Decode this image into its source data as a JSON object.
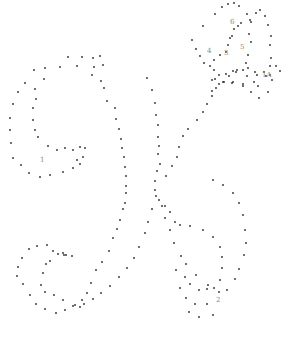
{
  "puzzle": {
    "subject": "cursive letter K dot-to-dot",
    "dot_color": "#2a2a2a",
    "label_color": "#8a8a8a",
    "labels": [
      {
        "text": "1",
        "x": 40,
        "y": 162
      },
      {
        "text": "2",
        "x": 216,
        "y": 302
      },
      {
        "text": "3",
        "x": 224,
        "y": 55
      },
      {
        "text": "4",
        "x": 207,
        "y": 53
      },
      {
        "text": "5",
        "x": 240,
        "y": 49
      },
      {
        "text": "6",
        "x": 230,
        "y": 24
      },
      {
        "text": "1A",
        "x": 262,
        "y": 77
      }
    ],
    "dots": [
      [
        68,
        57
      ],
      [
        82,
        57
      ],
      [
        93,
        58
      ],
      [
        100,
        56
      ],
      [
        103,
        65
      ],
      [
        94,
        67
      ],
      [
        77,
        66
      ],
      [
        60,
        67
      ],
      [
        45,
        68
      ],
      [
        34,
        70
      ],
      [
        25,
        83
      ],
      [
        18,
        92
      ],
      [
        13,
        104
      ],
      [
        10,
        118
      ],
      [
        10,
        130
      ],
      [
        11,
        143
      ],
      [
        13,
        158
      ],
      [
        21,
        165
      ],
      [
        29,
        173
      ],
      [
        40,
        177
      ],
      [
        50,
        175
      ],
      [
        63,
        172
      ],
      [
        73,
        168
      ],
      [
        80,
        164
      ],
      [
        44,
        79
      ],
      [
        35,
        89
      ],
      [
        36,
        99
      ],
      [
        33,
        108
      ],
      [
        33,
        120
      ],
      [
        35,
        130
      ],
      [
        38,
        137
      ],
      [
        48,
        146
      ],
      [
        57,
        150
      ],
      [
        65,
        148
      ],
      [
        73,
        150
      ],
      [
        80,
        147
      ],
      [
        85,
        148
      ],
      [
        83,
        157
      ],
      [
        77,
        160
      ],
      [
        92,
        75
      ],
      [
        101,
        81
      ],
      [
        104,
        88
      ],
      [
        107,
        101
      ],
      [
        115,
        108
      ],
      [
        116,
        119
      ],
      [
        119,
        129
      ],
      [
        121,
        139
      ],
      [
        122,
        148
      ],
      [
        124,
        157
      ],
      [
        125,
        167
      ],
      [
        126,
        176
      ],
      [
        126,
        186
      ],
      [
        126,
        193
      ],
      [
        125,
        203
      ],
      [
        123,
        209
      ],
      [
        120,
        220
      ],
      [
        117,
        229
      ],
      [
        113,
        238
      ],
      [
        109,
        251
      ],
      [
        102,
        262
      ],
      [
        96,
        270
      ],
      [
        91,
        283
      ],
      [
        87,
        293
      ],
      [
        82,
        300
      ],
      [
        75,
        305
      ],
      [
        65,
        310
      ],
      [
        56,
        313
      ],
      [
        45,
        309
      ],
      [
        36,
        304
      ],
      [
        30,
        295
      ],
      [
        23,
        284
      ],
      [
        17,
        276
      ],
      [
        18,
        267
      ],
      [
        22,
        258
      ],
      [
        29,
        249
      ],
      [
        37,
        246
      ],
      [
        47,
        245
      ],
      [
        53,
        251
      ],
      [
        63,
        253
      ],
      [
        64,
        255
      ],
      [
        147,
        78
      ],
      [
        152,
        90
      ],
      [
        155,
        103
      ],
      [
        156,
        115
      ],
      [
        158,
        125
      ],
      [
        158,
        137
      ],
      [
        159,
        146
      ],
      [
        158,
        154
      ],
      [
        160,
        164
      ],
      [
        157,
        171
      ],
      [
        155,
        181
      ],
      [
        156,
        196
      ],
      [
        152,
        209
      ],
      [
        148,
        222
      ],
      [
        145,
        233
      ],
      [
        139,
        247
      ],
      [
        134,
        258
      ],
      [
        127,
        268
      ],
      [
        119,
        277
      ],
      [
        110,
        286
      ],
      [
        101,
        293
      ],
      [
        93,
        299
      ],
      [
        84,
        304
      ],
      [
        80,
        307
      ],
      [
        73,
        306
      ],
      [
        63,
        300
      ],
      [
        54,
        295
      ],
      [
        45,
        292
      ],
      [
        41,
        285
      ],
      [
        43,
        273
      ],
      [
        46,
        264
      ],
      [
        50,
        261
      ],
      [
        58,
        254
      ],
      [
        66,
        255
      ],
      [
        72,
        256
      ],
      [
        155,
        190
      ],
      [
        162,
        206
      ],
      [
        165,
        218
      ],
      [
        170,
        230
      ],
      [
        174,
        243
      ],
      [
        181,
        256
      ],
      [
        186,
        264
      ],
      [
        196,
        275
      ],
      [
        208,
        285
      ],
      [
        219,
        292
      ],
      [
        227,
        290
      ],
      [
        235,
        279
      ],
      [
        239,
        269
      ],
      [
        244,
        255
      ],
      [
        246,
        243
      ],
      [
        245,
        230
      ],
      [
        243,
        215
      ],
      [
        239,
        203
      ],
      [
        233,
        193
      ],
      [
        223,
        185
      ],
      [
        213,
        180
      ],
      [
        159,
        200
      ],
      [
        165,
        206
      ],
      [
        170,
        212
      ],
      [
        175,
        222
      ],
      [
        180,
        225
      ],
      [
        190,
        226
      ],
      [
        203,
        230
      ],
      [
        213,
        237
      ],
      [
        220,
        247
      ],
      [
        222,
        257
      ],
      [
        222,
        268
      ],
      [
        220,
        280
      ],
      [
        214,
        288
      ],
      [
        207,
        289
      ],
      [
        199,
        290
      ],
      [
        190,
        284
      ],
      [
        185,
        277
      ],
      [
        176,
        270
      ],
      [
        180,
        288
      ],
      [
        186,
        298
      ],
      [
        195,
        304
      ],
      [
        207,
        304
      ],
      [
        213,
        315
      ],
      [
        199,
        317
      ],
      [
        189,
        312
      ],
      [
        166,
        176
      ],
      [
        172,
        166
      ],
      [
        177,
        157
      ],
      [
        179,
        147
      ],
      [
        183,
        136
      ],
      [
        188,
        129
      ],
      [
        197,
        120
      ],
      [
        203,
        112
      ],
      [
        207,
        104
      ],
      [
        212,
        96
      ],
      [
        216,
        88
      ],
      [
        224,
        82
      ],
      [
        229,
        76
      ],
      [
        237,
        70
      ],
      [
        248,
        68
      ],
      [
        255,
        72
      ],
      [
        266,
        76
      ],
      [
        272,
        80
      ],
      [
        268,
        92
      ],
      [
        259,
        98
      ],
      [
        251,
        92
      ],
      [
        243,
        86
      ],
      [
        233,
        82
      ],
      [
        212,
        91
      ],
      [
        219,
        84
      ],
      [
        223,
        82
      ],
      [
        232,
        83
      ],
      [
        243,
        84
      ],
      [
        254,
        82
      ],
      [
        258,
        86
      ],
      [
        270,
        75
      ],
      [
        276,
        66
      ],
      [
        280,
        71
      ],
      [
        192,
        40
      ],
      [
        196,
        49
      ],
      [
        200,
        56
      ],
      [
        204,
        63
      ],
      [
        210,
        66
      ],
      [
        214,
        70
      ],
      [
        214,
        60
      ],
      [
        220,
        55
      ],
      [
        226,
        52
      ],
      [
        228,
        45
      ],
      [
        230,
        38
      ],
      [
        232,
        36
      ],
      [
        234,
        29
      ],
      [
        238,
        26
      ],
      [
        241,
        23
      ],
      [
        250,
        20
      ],
      [
        256,
        13
      ],
      [
        260,
        10
      ],
      [
        265,
        16
      ],
      [
        268,
        25
      ],
      [
        271,
        36
      ],
      [
        270,
        45
      ],
      [
        271,
        58
      ],
      [
        270,
        66
      ],
      [
        264,
        72
      ],
      [
        257,
        75
      ],
      [
        247,
        76
      ],
      [
        233,
        71
      ],
      [
        226,
        74
      ],
      [
        219,
        75
      ],
      [
        215,
        79
      ],
      [
        212,
        80
      ],
      [
        203,
        26
      ],
      [
        215,
        14
      ],
      [
        222,
        7
      ],
      [
        228,
        4
      ],
      [
        234,
        3
      ],
      [
        239,
        6
      ],
      [
        247,
        14
      ],
      [
        251,
        22
      ],
      [
        249,
        34
      ],
      [
        251,
        42
      ],
      [
        248,
        55
      ],
      [
        246,
        63
      ],
      [
        243,
        70
      ],
      [
        236,
        72
      ]
    ]
  }
}
